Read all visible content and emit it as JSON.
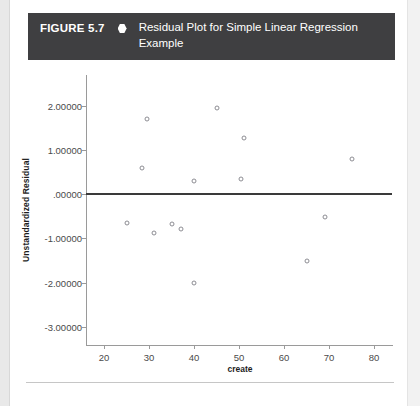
{
  "figure": {
    "number": "FIGURE 5.7",
    "bullet_icon": "hexagon-bullet-icon",
    "caption": "Residual Plot for Simple Linear Regression Example"
  },
  "chart_data": {
    "type": "scatter",
    "title": "Residual Plot for Simple Linear Regression Example",
    "xlabel": "create",
    "ylabel": "Unstandardized Residual",
    "xlim": [
      16,
      84
    ],
    "ylim": [
      -3.0,
      2.4
    ],
    "grid": false,
    "legend": null,
    "xticks": [
      20,
      30,
      40,
      50,
      60,
      70,
      80
    ],
    "xtick_labels": [
      "20",
      "30",
      "40",
      "50",
      "60",
      "70",
      "80"
    ],
    "yticks": [
      2.0,
      1.0,
      0.0,
      -1.0,
      -2.0,
      -3.0
    ],
    "ytick_labels": [
      "2.00000",
      "1.00000",
      ".00000",
      "-1.00000",
      "-2.00000",
      "-3.00000"
    ],
    "reference_line": {
      "type": "horizontal",
      "y": 0.0,
      "color": "#3a3a3a"
    },
    "marker": "open-circle",
    "marker_color": "#8d8d93",
    "points": [
      {
        "x": 25.0,
        "y": -0.65
      },
      {
        "x": 28.5,
        "y": 0.6
      },
      {
        "x": 29.5,
        "y": 1.7
      },
      {
        "x": 31.0,
        "y": -0.87
      },
      {
        "x": 35.0,
        "y": -0.68
      },
      {
        "x": 37.0,
        "y": -0.78
      },
      {
        "x": 40.0,
        "y": 0.31
      },
      {
        "x": 40.0,
        "y": -2.01
      },
      {
        "x": 45.0,
        "y": 1.95
      },
      {
        "x": 50.5,
        "y": 0.35
      },
      {
        "x": 51.0,
        "y": 1.28
      },
      {
        "x": 65.0,
        "y": -1.5
      },
      {
        "x": 69.0,
        "y": -0.52
      },
      {
        "x": 75.0,
        "y": 0.8
      }
    ]
  }
}
